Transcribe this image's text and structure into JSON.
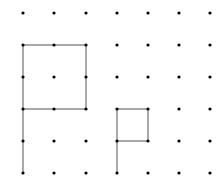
{
  "diagram": {
    "type": "dot-grid",
    "columns": 7,
    "rows": 6,
    "x_positions": [
      23,
      54,
      86,
      117,
      148,
      179,
      210
    ],
    "y_positions": [
      13,
      45,
      77,
      109,
      141,
      173
    ],
    "dot_color": "#000000",
    "line_color": "#555555",
    "segments": [
      {
        "from": [
          0,
          1
        ],
        "to": [
          2,
          1
        ]
      },
      {
        "from": [
          0,
          1
        ],
        "to": [
          0,
          5
        ]
      },
      {
        "from": [
          2,
          1
        ],
        "to": [
          2,
          3
        ]
      },
      {
        "from": [
          0,
          3
        ],
        "to": [
          2,
          3
        ]
      },
      {
        "from": [
          3,
          3
        ],
        "to": [
          4,
          3
        ]
      },
      {
        "from": [
          3,
          3
        ],
        "to": [
          3,
          5
        ]
      },
      {
        "from": [
          4,
          3
        ],
        "to": [
          4,
          4
        ]
      },
      {
        "from": [
          3,
          4
        ],
        "to": [
          4,
          4
        ]
      }
    ]
  }
}
